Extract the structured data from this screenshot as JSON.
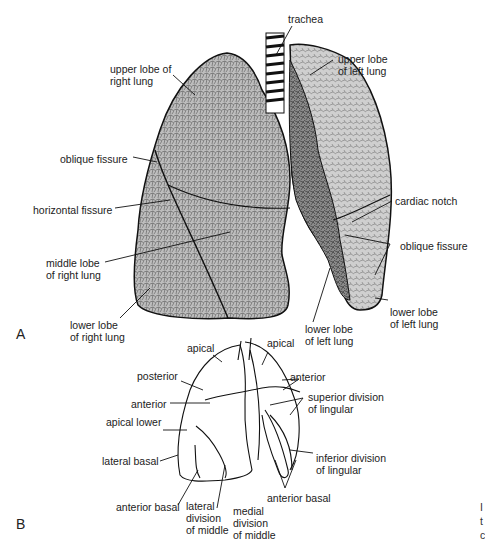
{
  "figure": {
    "panel_a": {
      "letter": "A",
      "labels": {
        "trachea": "trachea",
        "upper_right_1": "upper lobe of",
        "upper_right_2": "right lung",
        "upper_left_1": "upper lobe",
        "upper_left_2": "of left lung",
        "oblique_right": "oblique fissure",
        "horizontal": "horizontal fissure",
        "cardiac_notch": "cardiac notch",
        "middle_right_1": "middle lobe",
        "middle_right_2": "of right lung",
        "oblique_left": "oblique fissure",
        "lower_right_1": "lower lobe",
        "lower_right_2": "of right lung",
        "lower_left_a1": "lower lobe",
        "lower_left_a2": "of left lung",
        "lower_left_b1": "lower lobe",
        "lower_left_b2": "of left lung"
      }
    },
    "panel_b": {
      "letter": "B",
      "labels": {
        "apical_r": "apical",
        "apical_l": "apical",
        "posterior": "posterior",
        "anterior_l": "anterior",
        "anterior_r": "anterior",
        "apical_lower": "apical lower",
        "sup_ling_1": "superior division",
        "sup_ling_2": "of lingular",
        "lateral_basal": "lateral basal",
        "inf_ling_1": "inferior division",
        "inf_ling_2": "of lingular",
        "anterior_basal_r": "anterior basal",
        "anterior_basal_l": "anterior basal",
        "lat_div_1": "lateral",
        "lat_div_2": "division",
        "lat_div_3": "of middle",
        "med_div_1": "medial",
        "med_div_2": "division",
        "med_div_3": "of middle"
      }
    },
    "cut_off_text": [
      "I",
      "t",
      "c"
    ]
  }
}
